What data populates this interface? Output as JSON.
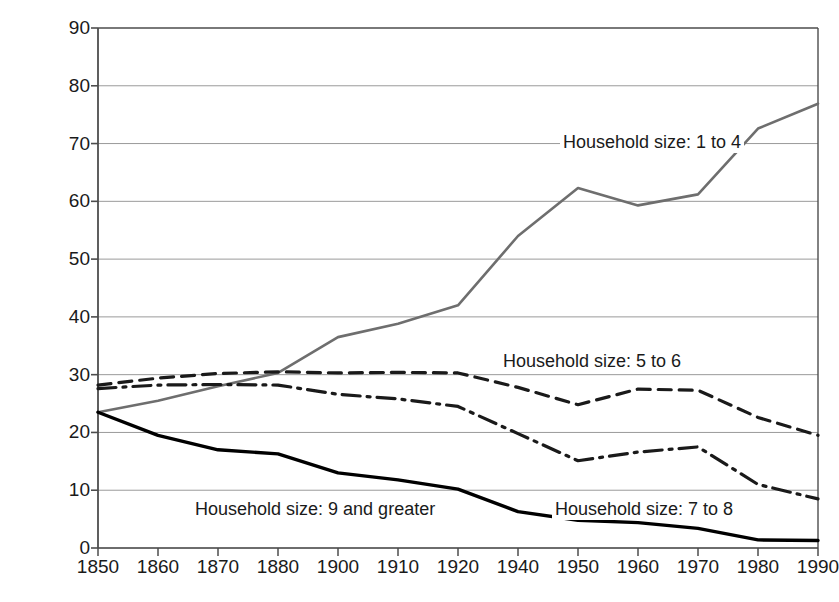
{
  "chart_data": {
    "type": "line",
    "title": "",
    "xlabel": "",
    "ylabel": "Percentage",
    "ylim": [
      0,
      90
    ],
    "ytick_values": [
      0,
      10,
      20,
      30,
      40,
      50,
      60,
      70,
      80,
      90
    ],
    "ytick_labels": [
      "0",
      "10",
      "20",
      "30",
      "40",
      "50",
      "60",
      "70",
      "80",
      "90"
    ],
    "grid": true,
    "grid_axis": "y",
    "legend_position": "inline-annotations",
    "categories": [
      "1850",
      "1860",
      "1870",
      "1880",
      "1900",
      "1910",
      "1920",
      "1940",
      "1950",
      "1960",
      "1970",
      "1980",
      "1990"
    ],
    "series": [
      {
        "name": "Household size: 1 to 4",
        "style": "solid-gray",
        "color": "#6e6e6e",
        "values": [
          23.5,
          25.5,
          28.0,
          30.3,
          36.5,
          38.8,
          42.0,
          54.0,
          62.3,
          59.3,
          61.2,
          72.6,
          76.9
        ],
        "label_x": 560,
        "label_y": 131
      },
      {
        "name": "Household size: 5 to 6",
        "style": "dashed",
        "color": "#1a1a1a",
        "values": [
          28.2,
          29.4,
          30.2,
          30.5,
          30.3,
          30.4,
          30.3,
          27.8,
          24.8,
          27.5,
          27.3,
          22.6,
          19.5
        ],
        "label_x": 500,
        "label_y": 350
      },
      {
        "name": "Household size: 7 to 8",
        "style": "dash-dot",
        "color": "#1a1a1a",
        "values": [
          27.6,
          28.2,
          28.3,
          28.2,
          26.6,
          25.8,
          24.5,
          19.8,
          15.1,
          16.6,
          17.5,
          11.0,
          8.5
        ],
        "label_x": 552,
        "label_y": 498
      },
      {
        "name": "Household size: 9 and greater",
        "style": "solid-black",
        "color": "#000000",
        "values": [
          23.5,
          19.5,
          17.0,
          16.3,
          13.0,
          11.8,
          10.2,
          6.3,
          4.8,
          4.4,
          3.4,
          1.4,
          1.3
        ],
        "label_x": 192,
        "label_y": 498
      }
    ]
  },
  "colors": {
    "gray_series": "#6e6e6e",
    "black_series": "#000000",
    "gridline": "#9a9a9a",
    "axis": "#4d4d4d",
    "background": "#ffffff"
  }
}
